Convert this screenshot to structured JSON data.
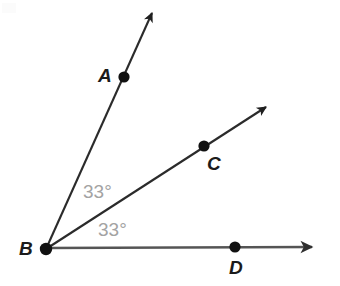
{
  "figure": {
    "type": "geometry-diagram",
    "background_color": "#ffffff",
    "line_color": "#2b2b2b",
    "base_line_color": "#555555",
    "point_color": "#111111",
    "label_color": "#1b1b1b",
    "angle_label_color": "#a3a3a3"
  },
  "points": [
    {
      "name": "A",
      "label": "A",
      "x": 124,
      "y": 77,
      "label_x": 98,
      "label_y": 66
    },
    {
      "name": "B",
      "label": "B",
      "x": 46,
      "y": 249,
      "label_x": 19,
      "label_y": 239
    },
    {
      "name": "C",
      "label": "C",
      "x": 204,
      "y": 146,
      "label_x": 207,
      "label_y": 154
    },
    {
      "name": "D",
      "label": "D",
      "x": 235,
      "y": 247,
      "label_x": 229,
      "label_y": 258
    }
  ],
  "rays": [
    {
      "name": "ray-BA",
      "from": "B",
      "through": "A",
      "x1": 46,
      "y1": 249,
      "x2": 155,
      "y2": 8,
      "arrow": true,
      "angle_deg": 66
    },
    {
      "name": "ray-BC",
      "from": "B",
      "through": "C",
      "x1": 46,
      "y1": 249,
      "x2": 270,
      "y2": 105,
      "arrow": true,
      "angle_deg": 33
    },
    {
      "name": "ray-BD",
      "from": "B",
      "through": "D",
      "x1": 46,
      "y1": 248,
      "x2": 316,
      "y2": 247,
      "arrow": true,
      "angle_deg": 0
    }
  ],
  "angles": [
    {
      "name": "angle-ABC",
      "value": "33°",
      "between": [
        "ray-BA",
        "ray-BC"
      ],
      "label_x": 83,
      "label_y": 182
    },
    {
      "name": "angle-CBD",
      "value": "33°",
      "between": [
        "ray-BC",
        "ray-BD"
      ],
      "label_x": 98,
      "label_y": 220
    }
  ],
  "labels": {
    "point_a": "A",
    "point_b": "B",
    "point_c": "C",
    "point_d": "D",
    "angle_upper": "33°",
    "angle_lower": "33°"
  }
}
